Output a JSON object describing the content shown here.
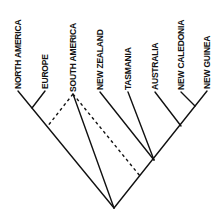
{
  "diagram": {
    "type": "cladogram",
    "taxa": [
      {
        "id": "north_america",
        "label": "NORTH AMERICA",
        "x": 18,
        "y": 91
      },
      {
        "id": "europe",
        "label": "EUROPE",
        "x": 45,
        "y": 91
      },
      {
        "id": "south_america",
        "label": "SOUTH AMERICA",
        "x": 73,
        "y": 94
      },
      {
        "id": "new_zealand",
        "label": "NEW ZEALAND",
        "x": 100,
        "y": 92
      },
      {
        "id": "tasmania",
        "label": "TASMANIA",
        "x": 128,
        "y": 92
      },
      {
        "id": "australia",
        "label": "AUSTRALIA",
        "x": 155,
        "y": 92
      },
      {
        "id": "new_caledonia",
        "label": "NEW CALEDONIA",
        "x": 181,
        "y": 92
      },
      {
        "id": "new_guinea",
        "label": "NEW GUINEA",
        "x": 207,
        "y": 91
      }
    ],
    "edges": {
      "solid": [
        {
          "from": "root",
          "to": "north_america"
        },
        {
          "from": "na_eu_node",
          "to": "europe"
        },
        {
          "from": "root",
          "to": "south_america"
        },
        {
          "from": "root",
          "to": "new_guinea"
        },
        {
          "from": "aus_node",
          "to": "new_zealand"
        },
        {
          "from": "aus_node",
          "to": "tasmania"
        },
        {
          "from": "australia_node",
          "to": "australia"
        },
        {
          "from": "ncal_ng_node",
          "to": "new_caledonia"
        }
      ],
      "dashed": [
        {
          "from": "south_america",
          "to": "left_junction"
        },
        {
          "from": "south_america",
          "to": "right_junction"
        }
      ]
    }
  }
}
